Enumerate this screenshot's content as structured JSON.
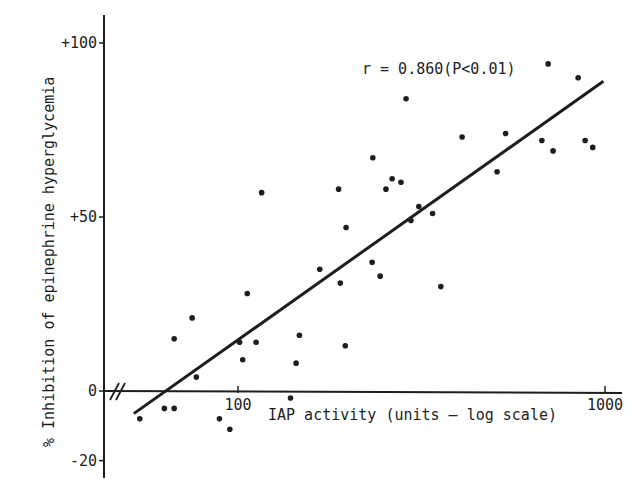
{
  "chart_data": {
    "type": "scatter",
    "title": "",
    "xlabel": "IAP activity (units — log scale)",
    "ylabel": "% Inhibition of epinephrine hyperglycemia",
    "x_scale": "log",
    "xlim": [
      45,
      1100
    ],
    "ylim": [
      -20,
      100
    ],
    "x_ticks": [
      100,
      1000
    ],
    "x_tick_labels": [
      "100",
      "1000"
    ],
    "y_ticks": [
      100,
      50,
      0,
      -20
    ],
    "y_tick_labels": [
      "+100",
      "+50",
      "0",
      "-20"
    ],
    "axis_break": "x-axis break near origin (//)",
    "grid": false,
    "legend": null,
    "annotation": "r = 0.860(P<0.01)",
    "regression_line": {
      "x": [
        52,
        990
      ],
      "y": [
        -6.5,
        89
      ]
    },
    "points": [
      {
        "x": 54,
        "y": -8
      },
      {
        "x": 63,
        "y": -5
      },
      {
        "x": 67,
        "y": -5
      },
      {
        "x": 67,
        "y": 15
      },
      {
        "x": 75,
        "y": 21
      },
      {
        "x": 77,
        "y": 4
      },
      {
        "x": 89,
        "y": -8
      },
      {
        "x": 95,
        "y": -11
      },
      {
        "x": 101,
        "y": 14
      },
      {
        "x": 103,
        "y": 9
      },
      {
        "x": 106,
        "y": 28
      },
      {
        "x": 112,
        "y": 14
      },
      {
        "x": 116,
        "y": 57
      },
      {
        "x": 139,
        "y": -2
      },
      {
        "x": 144,
        "y": 8
      },
      {
        "x": 147,
        "y": 16
      },
      {
        "x": 167,
        "y": 35
      },
      {
        "x": 188,
        "y": 58
      },
      {
        "x": 190,
        "y": 31
      },
      {
        "x": 196,
        "y": 13
      },
      {
        "x": 197,
        "y": 47
      },
      {
        "x": 232,
        "y": 37
      },
      {
        "x": 233,
        "y": 67
      },
      {
        "x": 244,
        "y": 33
      },
      {
        "x": 253,
        "y": 58
      },
      {
        "x": 263,
        "y": 61
      },
      {
        "x": 278,
        "y": 60
      },
      {
        "x": 287,
        "y": 84
      },
      {
        "x": 296,
        "y": 49
      },
      {
        "x": 311,
        "y": 53
      },
      {
        "x": 339,
        "y": 51
      },
      {
        "x": 357,
        "y": 30
      },
      {
        "x": 408,
        "y": 73
      },
      {
        "x": 508,
        "y": 63
      },
      {
        "x": 536,
        "y": 74
      },
      {
        "x": 673,
        "y": 72
      },
      {
        "x": 700,
        "y": 94
      },
      {
        "x": 722,
        "y": 69
      },
      {
        "x": 845,
        "y": 90
      },
      {
        "x": 883,
        "y": 72
      },
      {
        "x": 926,
        "y": 70
      }
    ]
  },
  "colors": {
    "ink": "#1e1e1e",
    "background": "#ffffff"
  }
}
